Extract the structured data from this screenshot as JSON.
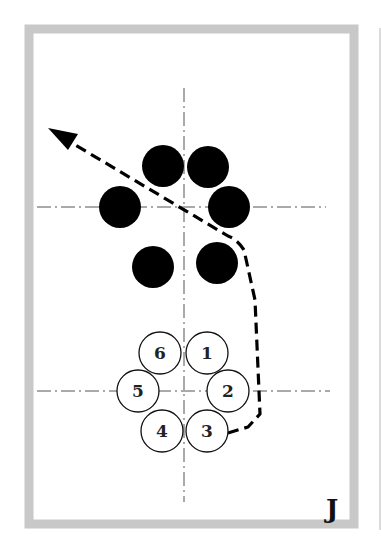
{
  "panel": {
    "label": "J",
    "frame_color": "#c8c8c8",
    "background": "#ffffff"
  },
  "axes": {
    "vertical": {
      "x": 184,
      "y1": 88,
      "y2": 502
    },
    "horizontal_top": {
      "y": 207,
      "x1": 37,
      "x2": 326
    },
    "horizontal_bottom": {
      "y": 391,
      "x1": 37,
      "x2": 330
    },
    "color": "#555555"
  },
  "black_players": [
    {
      "id": "b1",
      "cx": 163,
      "cy": 166
    },
    {
      "id": "b2",
      "cx": 208,
      "cy": 167
    },
    {
      "id": "b3",
      "cx": 229,
      "cy": 207
    },
    {
      "id": "b4",
      "cx": 120,
      "cy": 207
    },
    {
      "id": "b5",
      "cx": 153,
      "cy": 267
    },
    {
      "id": "b6",
      "cx": 217,
      "cy": 263
    }
  ],
  "white_players": [
    {
      "label": "1",
      "cx": 207,
      "cy": 353
    },
    {
      "label": "2",
      "cx": 228,
      "cy": 391
    },
    {
      "label": "3",
      "cx": 207,
      "cy": 431
    },
    {
      "label": "4",
      "cx": 162,
      "cy": 431
    },
    {
      "label": "5",
      "cx": 138,
      "cy": 391
    },
    {
      "label": "6",
      "cx": 160,
      "cy": 353
    }
  ],
  "player_radius": 21,
  "path": {
    "d": "M228,433 L248,427 L260,414 L255,300 L244,250 Q238,240 228,236 L62,137",
    "arrow_tip": [
      48,
      128
    ],
    "style": "dashed"
  }
}
